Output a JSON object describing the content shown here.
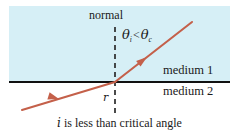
{
  "figure": {
    "title_caption": "i is less than critical angle",
    "caption_italic_symbol": "i",
    "caption_rest": " is less than critical angle",
    "normal_label": "normal",
    "angle_symbol_incident": "θ",
    "angle_subscript_incident": "i",
    "angle_relation": "<",
    "angle_symbol_critical": "θ",
    "angle_subscript_critical": "c",
    "refraction_angle_label": "r",
    "medium_upper": "medium 1",
    "medium_lower": "medium 2"
  },
  "colors": {
    "medium_upper_fill": "#d6eff6",
    "medium_lower_fill": "#ffffff",
    "interface_line": "#111111",
    "normal_dash": "#333333",
    "ray": "#c4604a",
    "text": "#1a1a1a",
    "page_background": "#ffffff"
  },
  "geometry": {
    "interface_y": 82,
    "normal_x": 115,
    "normal_top_y": 27,
    "normal_bottom_y": 113,
    "incident_ray_start": [
      192,
      22
    ],
    "incident_ray_end": [
      115,
      82
    ],
    "refracted_ray_start": [
      115,
      82
    ],
    "refracted_ray_end": [
      22,
      110
    ],
    "incident_arrow_at": [
      152,
      52
    ],
    "refracted_arrow_at": [
      63,
      98
    ]
  }
}
